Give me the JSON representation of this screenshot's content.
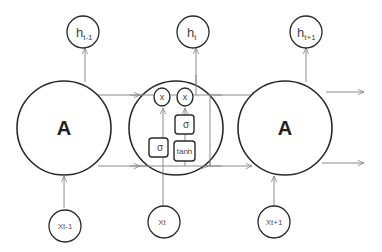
{
  "diagram": {
    "type": "unrolled-lstm",
    "colors": {
      "cell_stroke": "#2a2a2a",
      "edge_stroke": "#8a8a8a",
      "background": "#ffffff"
    },
    "cells": [
      {
        "id": "cell-left",
        "label": "A"
      },
      {
        "id": "cell-middle",
        "label": ""
      },
      {
        "id": "cell-right",
        "label": "A"
      }
    ],
    "outputs": [
      {
        "base": "h",
        "sub": "t-1"
      },
      {
        "base": "h",
        "sub": "t"
      },
      {
        "base": "h",
        "sub": "t+1"
      }
    ],
    "inputs": [
      {
        "label": "Xt-1"
      },
      {
        "label": "Xt"
      },
      {
        "label": "Xt+1"
      }
    ],
    "middle_cell_internals": {
      "multiply_ops": [
        "x",
        "x"
      ],
      "gates": [
        {
          "id": "sigma-left",
          "label": "σ"
        },
        {
          "id": "sigma-top",
          "label": "σ"
        },
        {
          "id": "tanh",
          "label": "tanh"
        }
      ]
    }
  }
}
